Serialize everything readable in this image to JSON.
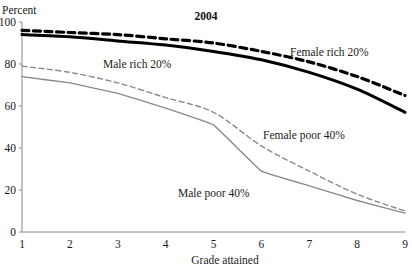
{
  "chart_data": {
    "type": "line",
    "title": "2004",
    "xlabel": "Grade attained",
    "ylabel": "Percent",
    "x": [
      1,
      2,
      3,
      4,
      5,
      6,
      7,
      8,
      9
    ],
    "xlim": [
      1,
      9
    ],
    "ylim": [
      0,
      100
    ],
    "yticks": [
      0,
      20,
      40,
      60,
      80,
      100
    ],
    "xticks": [
      1,
      2,
      3,
      4,
      5,
      6,
      7,
      8,
      9
    ],
    "grid": false,
    "legend_position": "inline-annotations",
    "series": [
      {
        "name": "Female rich 20%",
        "values": [
          96,
          95,
          94,
          92,
          90,
          86,
          81,
          74,
          65
        ],
        "color": "#000000",
        "style": "dashed",
        "width": 3.2,
        "label_x": 290,
        "label_y": 56
      },
      {
        "name": "Male rich 20%",
        "values": [
          94,
          93,
          91,
          89,
          86,
          82,
          76,
          68,
          57
        ],
        "color": "#000000",
        "style": "solid",
        "width": 3.0,
        "label_x": 103,
        "label_y": 68
      },
      {
        "name": "Female poor 40%",
        "values": [
          79,
          76,
          71,
          64,
          57,
          41,
          29,
          18,
          10
        ],
        "color": "#8a8a8a",
        "style": "dashed",
        "width": 1.4,
        "label_x": 263,
        "label_y": 139
      },
      {
        "name": "Male poor 40%",
        "values": [
          74,
          71,
          66,
          59,
          51,
          29,
          22,
          15,
          9
        ],
        "color": "#8a8a8a",
        "style": "solid",
        "width": 1.4,
        "label_x": 178,
        "label_y": 197
      }
    ],
    "annotations": [
      {
        "text": "2004",
        "x": 206,
        "y": 20
      }
    ]
  },
  "axis": {
    "y_tick_labels": [
      "100",
      "80",
      "60",
      "40",
      "20",
      "0"
    ],
    "x_tick_labels": [
      "1",
      "2",
      "3",
      "4",
      "5",
      "6",
      "7",
      "8",
      "9"
    ],
    "y_axis_caption": "Percent",
    "x_axis_caption": "Grade attained"
  },
  "plot_geometry": {
    "x0": 22,
    "x1": 405,
    "y0": 232,
    "y1": 22
  }
}
